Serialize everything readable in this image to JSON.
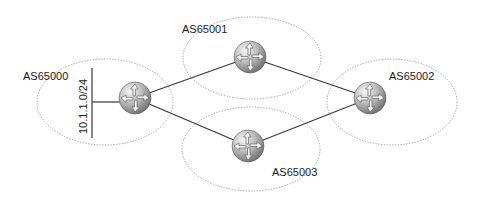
{
  "diagram": {
    "autonomous_systems": [
      {
        "id": "as65000",
        "label": "AS65000",
        "cx": 105,
        "cy": 102,
        "rx": 68,
        "ry": 43,
        "label_x": 23,
        "label_y": 71
      },
      {
        "id": "as65001",
        "label": "AS65001",
        "cx": 252,
        "cy": 58,
        "rx": 69,
        "ry": 41,
        "label_x": 182,
        "label_y": 24
      },
      {
        "id": "as65002",
        "label": "AS65002",
        "cx": 392,
        "cy": 102,
        "rx": 65,
        "ry": 43,
        "label_x": 389,
        "label_y": 71
      },
      {
        "id": "as65003",
        "label": "AS65003",
        "cx": 251,
        "cy": 149,
        "rx": 69,
        "ry": 42,
        "label_x": 272,
        "label_y": 167
      }
    ],
    "routers": [
      {
        "id": "r-as65000",
        "cx": 135,
        "cy": 98,
        "r": 16
      },
      {
        "id": "r-as65001",
        "cx": 250,
        "cy": 57,
        "r": 16
      },
      {
        "id": "r-as65002",
        "cx": 370,
        "cy": 98,
        "r": 16
      },
      {
        "id": "r-as65003",
        "cx": 248,
        "cy": 146,
        "r": 16
      }
    ],
    "links": [
      {
        "from": "r-as65000",
        "to": "r-as65001"
      },
      {
        "from": "r-as65000",
        "to": "r-as65003"
      },
      {
        "from": "r-as65001",
        "to": "r-as65002"
      },
      {
        "from": "r-as65003",
        "to": "r-as65002"
      }
    ],
    "network": {
      "label": "10.1.1.0/24",
      "x": 92,
      "y1": 68,
      "y2": 138,
      "stub_y": 102
    },
    "colors": {
      "router_light": "#f4f4f4",
      "router_mid": "#b5b5b5",
      "router_dark": "#6e6e6e",
      "boundary": "#9a9a9a",
      "link": "#3a3a3a"
    }
  }
}
